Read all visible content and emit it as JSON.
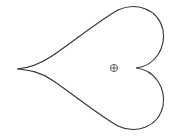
{
  "diagram": {
    "shape": "heart-outline",
    "orientation": "pointing-left",
    "stroke_color": "#333333",
    "background_color": "#ffffff",
    "marker": {
      "type": "circled-plus",
      "glyph": "⊕",
      "center": [
        114,
        68
      ]
    },
    "tip": [
      17,
      69
    ],
    "notch": [
      136,
      68
    ]
  }
}
